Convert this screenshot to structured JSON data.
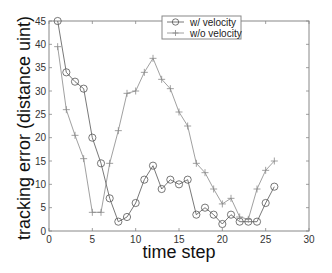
{
  "chart_data": {
    "type": "line",
    "title": "",
    "xlabel": "time step",
    "ylabel": "tracking error (distance uint)",
    "xlim": [
      0,
      30
    ],
    "ylim": [
      0,
      45
    ],
    "xticks": [
      0,
      5,
      10,
      15,
      20,
      25,
      30
    ],
    "yticks": [
      0,
      5,
      10,
      15,
      20,
      25,
      30,
      35,
      40,
      45
    ],
    "grid": false,
    "legend_position": "upper center",
    "series": [
      {
        "name": "w/ velocity",
        "marker": "circle",
        "color": "#555555",
        "x": [
          1,
          2,
          3,
          4,
          5,
          6,
          7,
          8,
          9,
          10,
          11,
          12,
          13,
          14,
          15,
          16,
          17,
          18,
          19,
          20,
          21,
          22,
          23,
          24,
          25,
          26
        ],
        "values": [
          45,
          34,
          32,
          30.5,
          20,
          14.5,
          7,
          2,
          3,
          6,
          11,
          14,
          9,
          11,
          10,
          11,
          3.5,
          5,
          3.5,
          1.5,
          3.5,
          2,
          2,
          2,
          6,
          9.5
        ]
      },
      {
        "name": "w/o velocity",
        "marker": "plus",
        "color": "#888888",
        "x": [
          1,
          2,
          3,
          4,
          5,
          6,
          7,
          8,
          9,
          10,
          11,
          12,
          13,
          14,
          15,
          16,
          17,
          18,
          19,
          20,
          21,
          22,
          23,
          24,
          25,
          26
        ],
        "values": [
          39.5,
          26,
          20.5,
          15.5,
          4,
          4,
          14.5,
          21.5,
          29.5,
          30,
          34,
          37,
          32.5,
          30.5,
          25.5,
          22.5,
          14.5,
          12.5,
          9,
          5.8,
          7,
          3,
          2.5,
          9,
          13,
          15
        ]
      }
    ]
  }
}
